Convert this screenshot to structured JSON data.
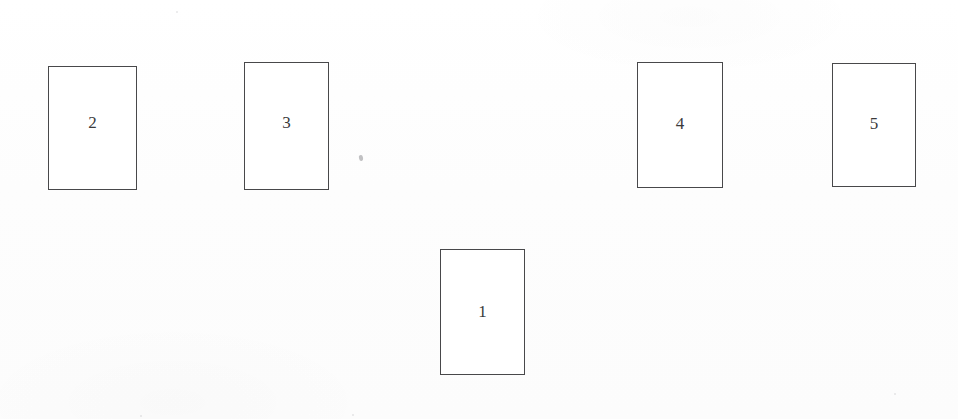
{
  "page": {
    "kind": "scanned-diagram",
    "background_color": "#fdfdfd",
    "width": 958,
    "height": 419
  },
  "diagram": {
    "stroke_color": "#4d4d4f",
    "fill_color": "#ffffff",
    "label_color": "#3a3a3c",
    "boxes": [
      {
        "label": "2",
        "x": 48,
        "y": 66,
        "w": 89,
        "h": 124,
        "label_offset_y": -6
      },
      {
        "label": "3",
        "x": 244,
        "y": 62,
        "w": 85,
        "h": 128,
        "label_offset_y": -4
      },
      {
        "label": "4",
        "x": 637,
        "y": 62,
        "w": 86,
        "h": 126,
        "label_offset_y": -2
      },
      {
        "label": "5",
        "x": 832,
        "y": 63,
        "w": 84,
        "h": 124,
        "label_offset_y": -2
      },
      {
        "label": "1",
        "x": 440,
        "y": 249,
        "w": 85,
        "h": 126,
        "label_offset_y": -1
      }
    ],
    "artifacts": [
      {
        "name": "ink-speck",
        "x": 359,
        "y": 155,
        "w": 4,
        "h": 6
      }
    ],
    "dust": [
      {
        "x": 176,
        "y": 11,
        "d": 2
      },
      {
        "x": 140,
        "y": 415,
        "d": 2
      },
      {
        "x": 352,
        "y": 414,
        "d": 2
      },
      {
        "x": 894,
        "y": 393,
        "d": 2
      }
    ]
  }
}
